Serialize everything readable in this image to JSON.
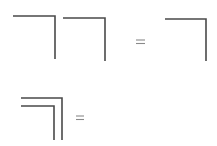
{
  "diagram": {
    "stroke_color": "#4a4a4a",
    "equals_color": "#9a9a9a",
    "rows": [
      {
        "name": "row-1",
        "left_terms": [
          {
            "shape": "corner-bracket",
            "x1": 13,
            "x2": 55,
            "y1": 16,
            "y2": 59
          },
          {
            "shape": "corner-bracket",
            "x1": 63,
            "x2": 105,
            "y1": 18,
            "y2": 61
          }
        ],
        "operator": "=",
        "right_terms": [
          {
            "shape": "corner-bracket",
            "x1": 165,
            "x2": 206,
            "y1": 19,
            "y2": 61
          }
        ]
      },
      {
        "name": "row-2",
        "left_terms": [
          {
            "shape": "nested-corner-bracket-outer",
            "x1": 21,
            "x2": 62,
            "y1": 98,
            "y2": 140
          },
          {
            "shape": "nested-corner-bracket-inner",
            "x1": 21,
            "x2": 54,
            "y1": 106,
            "y2": 140
          }
        ],
        "operator": "=",
        "right_terms": []
      }
    ]
  }
}
